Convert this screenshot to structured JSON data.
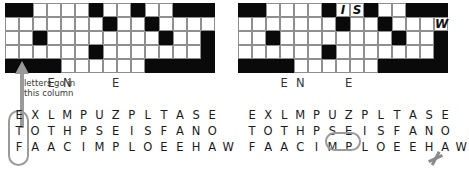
{
  "meta": {
    "colors": {
      "block": "#0a0a0a",
      "grid_line": "#8f8f8f",
      "annotation": "#9a9a9a",
      "text": "#1a1a1a",
      "background": "#ffffff"
    }
  },
  "annotation": {
    "note_line1": "letters go in",
    "note_line2": "this column",
    "arrow_icon": "up-arrow-icon",
    "circle_icon": "oval-highlight-icon",
    "strike_icon": "strikethrough-icon"
  },
  "grid": {
    "rows": 5,
    "cols": 15,
    "blocked": [
      [
        1,
        1,
        0,
        0,
        0,
        0,
        1,
        0,
        0,
        1,
        0,
        0,
        1,
        1,
        1
      ],
      [
        0,
        0,
        0,
        0,
        0,
        0,
        0,
        1,
        0,
        0,
        1,
        0,
        0,
        0,
        0
      ],
      [
        0,
        0,
        1,
        0,
        0,
        0,
        0,
        0,
        0,
        0,
        0,
        1,
        0,
        0,
        1
      ],
      [
        0,
        0,
        0,
        0,
        0,
        0,
        1,
        0,
        0,
        0,
        0,
        0,
        0,
        0,
        1
      ],
      [
        1,
        1,
        1,
        1,
        0,
        0,
        0,
        0,
        0,
        0,
        1,
        1,
        1,
        1,
        1
      ]
    ]
  },
  "left_panel": {
    "name": "before-state",
    "grid_entries": [],
    "letter_rows": [
      {
        "id": "row-top",
        "text": "    E N     E          "
      },
      {
        "id": "row-second",
        "text": "   L O L   Z H R       "
      },
      {
        "id": "row-1",
        "text": "E X L M P U Z P L T A S E"
      },
      {
        "id": "row-2",
        "text": "T O T H P S E I S F A N O"
      },
      {
        "id": "row-3",
        "text": "F A A C I M P L O E E H A W"
      }
    ],
    "circled_column": [
      "E",
      "T",
      "F"
    ]
  },
  "right_panel": {
    "name": "after-state",
    "grid_entries": [
      {
        "row": 0,
        "col": 7,
        "letter": "I"
      },
      {
        "row": 0,
        "col": 8,
        "letter": "S"
      },
      {
        "row": 1,
        "col": 14,
        "letter": "W"
      }
    ],
    "letter_rows": [
      {
        "id": "row-top",
        "text": "    E N     E          "
      },
      {
        "id": "row-second",
        "text": "   L O L   Z H R       "
      },
      {
        "id": "row-1",
        "text": "E X L M P U Z P L T A S E"
      },
      {
        "id": "row-2",
        "text": "T O T H P S E I S F A N O"
      },
      {
        "id": "row-3",
        "text": "F A A C I M P L O E E H A W"
      }
    ],
    "circled_letters": [
      "I",
      "S"
    ],
    "struck_letter": "W"
  }
}
